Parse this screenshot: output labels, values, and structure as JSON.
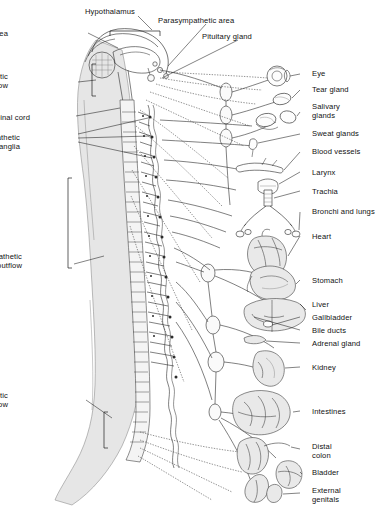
{
  "figure": {
    "background_color": "#ffffff",
    "ink_color": "#2b2b2b",
    "body_shade_color": "#e6e6e6"
  },
  "left_labels": [
    {
      "id": "sympathetic-area",
      "text": "Sympathetic area",
      "x": 8,
      "y": 30
    },
    {
      "id": "parasympathetic-outflow-cranial",
      "text": "Parasympathetic\noutflow",
      "x": 8,
      "y": 73
    },
    {
      "id": "spinal-cord",
      "text": "Spinal cord",
      "x": 30,
      "y": 114
    },
    {
      "id": "sympathetic-ganglia",
      "text": "Sympathetic\nganglia",
      "x": 20,
      "y": 134
    },
    {
      "id": "sympathetic-outflow",
      "text": "Sympathetic\noutflow",
      "x": 22,
      "y": 253
    },
    {
      "id": "parasympathetic-outflow-sacral",
      "text": "Parasympathetic\noutflow",
      "x": 8,
      "y": 392
    }
  ],
  "top_labels": [
    {
      "id": "hypothalamus",
      "text": "Hypothalamus",
      "x": 85,
      "y": 8
    },
    {
      "id": "parasympathetic-area",
      "text": "Parasympathetic area",
      "x": 158,
      "y": 17
    },
    {
      "id": "pituitary-gland",
      "text": "Pituitary gland",
      "x": 202,
      "y": 33
    }
  ],
  "organ_labels": [
    {
      "id": "eye",
      "text": "Eye",
      "x": 312,
      "y": 70
    },
    {
      "id": "tear-gland",
      "text": "Tear gland",
      "x": 312,
      "y": 86
    },
    {
      "id": "salivary-glands",
      "text": "Salivary\nglands",
      "x": 312,
      "y": 103
    },
    {
      "id": "sweat-glands",
      "text": "Sweat glands",
      "x": 312,
      "y": 130
    },
    {
      "id": "blood-vessels",
      "text": "Blood vessels",
      "x": 312,
      "y": 148
    },
    {
      "id": "larynx",
      "text": "Larynx",
      "x": 312,
      "y": 169
    },
    {
      "id": "trachia",
      "text": "Trachia",
      "x": 312,
      "y": 188
    },
    {
      "id": "bronchi-lungs",
      "text": "Bronchi and lungs",
      "x": 312,
      "y": 208
    },
    {
      "id": "heart",
      "text": "Heart",
      "x": 312,
      "y": 233
    },
    {
      "id": "stomach",
      "text": "Stomach",
      "x": 312,
      "y": 277
    },
    {
      "id": "liver",
      "text": "Liver",
      "x": 312,
      "y": 301
    },
    {
      "id": "gallbladder",
      "text": "Gallbladder",
      "x": 312,
      "y": 314
    },
    {
      "id": "bile-ducts",
      "text": "Bile ducts",
      "x": 312,
      "y": 327
    },
    {
      "id": "adrenal-gland",
      "text": "Adrenal gland",
      "x": 312,
      "y": 340
    },
    {
      "id": "kidney",
      "text": "Kidney",
      "x": 312,
      "y": 364
    },
    {
      "id": "intestines",
      "text": "Intestines",
      "x": 312,
      "y": 408
    },
    {
      "id": "distal-colon",
      "text": "Distal\ncolon",
      "x": 312,
      "y": 443
    },
    {
      "id": "bladder",
      "text": "Bladder",
      "x": 312,
      "y": 469
    },
    {
      "id": "external-genitals",
      "text": "External\ngenitals",
      "x": 312,
      "y": 487
    }
  ]
}
